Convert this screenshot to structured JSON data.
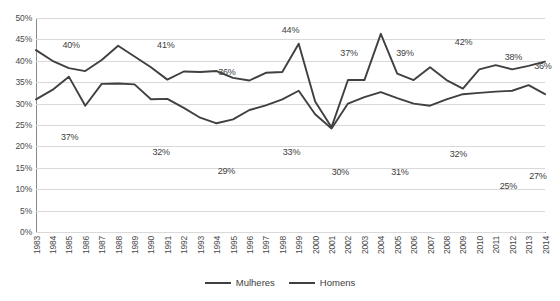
{
  "chart_data": {
    "type": "line",
    "title": "",
    "xlabel": "",
    "ylabel": "",
    "ylim": [
      0,
      50
    ],
    "ytick_step": 5,
    "grid": true,
    "legend_position": "bottom-center",
    "yticks": [
      "50%",
      "45%",
      "40%",
      "35%",
      "30%",
      "25%",
      "20%",
      "15%",
      "10%",
      "5%",
      "0%"
    ],
    "categories": [
      "1983",
      "1984",
      "1985",
      "1986",
      "1987",
      "1988",
      "1989",
      "1990",
      "1991",
      "1992",
      "1993",
      "1994",
      "1995",
      "1996",
      "1997",
      "1998",
      "1999",
      "2000",
      "2001",
      "2002",
      "2003",
      "2004",
      "2005",
      "2006",
      "2007",
      "2008",
      "2009",
      "2010",
      "2011",
      "2012",
      "2013",
      "2014"
    ],
    "series": [
      {
        "name": "Mulheres",
        "color": "#404040",
        "values": [
          42.5,
          40.0,
          38.3,
          37.6,
          40.2,
          43.5,
          41.0,
          38.5,
          35.6,
          37.5,
          37.4,
          37.6,
          36.0,
          35.4,
          37.2,
          37.4,
          44.0,
          30.5,
          24.5,
          35.5,
          35.5,
          46.3,
          37.0,
          35.5,
          38.5,
          35.5,
          33.5,
          38.0,
          39.0,
          38.0,
          38.8,
          39.8
        ]
      },
      {
        "name": "Homens",
        "color": "#404040",
        "values": [
          31.0,
          33.2,
          36.3,
          29.5,
          34.6,
          34.7,
          34.5,
          31.0,
          31.1,
          29.0,
          26.7,
          25.4,
          26.3,
          28.5,
          29.6,
          31.0,
          33.0,
          27.5,
          24.2,
          30.0,
          31.5,
          32.7,
          31.3,
          30.0,
          29.5,
          31.0,
          32.2,
          32.5,
          32.8,
          33.0,
          34.3,
          32.2
        ]
      }
    ],
    "data_labels": [
      {
        "text": "40%",
        "series": "Mulheres",
        "x_pct": 6.9,
        "y_pct": 12.5
      },
      {
        "text": "37%",
        "series": "Homens",
        "x_pct": 6.6,
        "y_pct": 55.5
      },
      {
        "text": "41%",
        "series": "Mulheres",
        "x_pct": 25.5,
        "y_pct": 12.5
      },
      {
        "text": "32%",
        "series": "Homens",
        "x_pct": 24.6,
        "y_pct": 62.5
      },
      {
        "text": "36%",
        "series": "Mulheres",
        "x_pct": 37.5,
        "y_pct": 25.0
      },
      {
        "text": "29%",
        "series": "Homens",
        "x_pct": 37.4,
        "y_pct": 71.5
      },
      {
        "text": "44%",
        "series": "Mulheres",
        "x_pct": 50.0,
        "y_pct": 5.5
      },
      {
        "text": "33%",
        "series": "Homens",
        "x_pct": 50.2,
        "y_pct": 62.5
      },
      {
        "text": "37%",
        "series": "Mulheres",
        "x_pct": 61.5,
        "y_pct": 16.5
      },
      {
        "text": "30%",
        "series": "Homens",
        "x_pct": 59.8,
        "y_pct": 72.0
      },
      {
        "text": "39%",
        "series": "Mulheres",
        "x_pct": 72.5,
        "y_pct": 16.5
      },
      {
        "text": "31%",
        "series": "Homens",
        "x_pct": 71.5,
        "y_pct": 72.0
      },
      {
        "text": "42%",
        "series": "Mulheres",
        "x_pct": 84.0,
        "y_pct": 11.0
      },
      {
        "text": "32%",
        "series": "Homens",
        "x_pct": 83.0,
        "y_pct": 63.5
      },
      {
        "text": "38%",
        "series": "Mulheres",
        "x_pct": 93.8,
        "y_pct": 18.0
      },
      {
        "text": "25%",
        "series": "Homens",
        "x_pct": 92.8,
        "y_pct": 78.5
      },
      {
        "text": "36%",
        "series": "Mulheres",
        "x_pct": 99.6,
        "y_pct": 22.5
      },
      {
        "text": "27%",
        "series": "Homens",
        "x_pct": 98.6,
        "y_pct": 74.0
      }
    ]
  },
  "legend": {
    "items": [
      {
        "label": "Mulheres"
      },
      {
        "label": "Homens"
      }
    ]
  }
}
